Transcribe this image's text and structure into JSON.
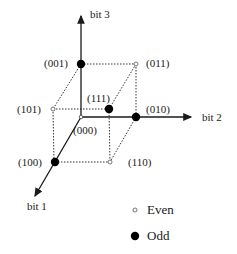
{
  "axes": {
    "bit1": "bit 1",
    "bit2": "bit 2",
    "bit3": "bit 3"
  },
  "vertices": [
    {
      "code": "(000)",
      "parity": "even"
    },
    {
      "code": "(001)",
      "parity": "odd"
    },
    {
      "code": "(010)",
      "parity": "odd"
    },
    {
      "code": "(011)",
      "parity": "even"
    },
    {
      "code": "(100)",
      "parity": "odd"
    },
    {
      "code": "(101)",
      "parity": "even"
    },
    {
      "code": "(110)",
      "parity": "even"
    },
    {
      "code": "(111)",
      "parity": "odd"
    }
  ],
  "legend": {
    "even": "Even",
    "odd": "Odd"
  },
  "colors": {
    "line": "#1a1a1a",
    "odd_fill": "#000000",
    "even_fill": "#ffffff"
  }
}
